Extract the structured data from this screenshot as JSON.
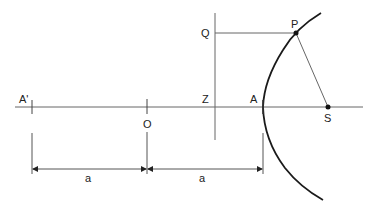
{
  "diagram": {
    "points": {
      "A_prime": {
        "label": "A'",
        "x": 32,
        "y": 107
      },
      "O": {
        "label": "O",
        "x": 147,
        "y": 107
      },
      "Z": {
        "label": "Z",
        "x": 215,
        "y": 107
      },
      "A": {
        "label": "A",
        "x": 263,
        "y": 107
      },
      "S": {
        "label": "S",
        "x": 328,
        "y": 107
      },
      "Q": {
        "label": "Q",
        "x": 215,
        "y": 33
      },
      "P": {
        "label": "P",
        "x": 296,
        "y": 33
      }
    },
    "dimensions": [
      {
        "label": "a",
        "from": "A'",
        "to": "O"
      },
      {
        "label": "a",
        "from": "O",
        "to": "A"
      }
    ],
    "colors": {
      "line": "#555555",
      "curve": "#1a1a1a",
      "text": "#222222"
    }
  }
}
